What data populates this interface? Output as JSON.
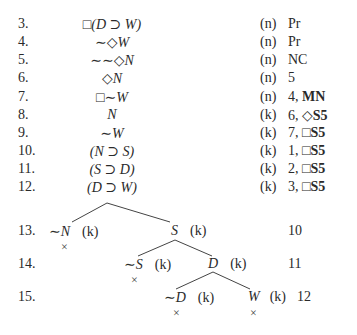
{
  "lines": [
    {
      "num": "3.",
      "formula": "□(D ⊃ W)",
      "world": "(n)",
      "just": "Pr"
    },
    {
      "num": "4.",
      "formula": "∼◇W",
      "world": "(n)",
      "just": "Pr"
    },
    {
      "num": "5.",
      "formula": "∼∼◇N",
      "world": "(n)",
      "just": "NC"
    },
    {
      "num": "6.",
      "formula": "◇N",
      "world": "(n)",
      "just": "5"
    },
    {
      "num": "7.",
      "formula": "□∼W",
      "world": "(n)",
      "just": "4, MN"
    },
    {
      "num": "8.",
      "formula": "N",
      "world": "(k)",
      "just": "6, ◇S5"
    },
    {
      "num": "9.",
      "formula": "∼W",
      "world": "(k)",
      "just": "7, □S5"
    },
    {
      "num": "10.",
      "formula": "(N ⊃ S)",
      "world": "(k)",
      "just": "1, □S5"
    },
    {
      "num": "11.",
      "formula": "(S ⊃ D)",
      "world": "(k)",
      "just": "2, □S5"
    },
    {
      "num": "12.",
      "formula": "(D ⊃ W)",
      "world": "(k)",
      "just": "3, □S5"
    }
  ],
  "tree": {
    "row13": {
      "num": "13.",
      "left": {
        "formula": "∼N",
        "world": "(k)",
        "closed": "×"
      },
      "right": {
        "formula": "S",
        "world": "(k)"
      },
      "just": "10"
    },
    "row14": {
      "num": "14.",
      "left": {
        "formula": "∼S",
        "world": "(k)",
        "closed": "×"
      },
      "right": {
        "formula": "D",
        "world": "(k)"
      },
      "just": "11"
    },
    "row15": {
      "num": "15.",
      "left": {
        "formula": "∼D",
        "world": "(k)",
        "closed": "×"
      },
      "right": {
        "formula": "W",
        "world": "(k)",
        "closed": "×"
      },
      "just": "12"
    }
  }
}
